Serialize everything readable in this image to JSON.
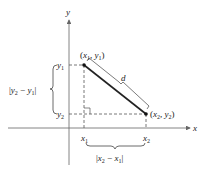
{
  "diagram": {
    "axes": {
      "x_label": "x",
      "y_label": "y"
    },
    "points": {
      "p1": {
        "label_x": "x",
        "label_y": "y",
        "sub": "1",
        "text": "(x1, y1)"
      },
      "p2": {
        "label_x": "x",
        "label_y": "y",
        "sub": "2",
        "text": "(x2, y2)"
      }
    },
    "ticks": {
      "x1": {
        "base": "x",
        "sub": "1"
      },
      "x2": {
        "base": "x",
        "sub": "2"
      },
      "y1": {
        "base": "y",
        "sub": "1"
      },
      "y2": {
        "base": "y",
        "sub": "2"
      }
    },
    "distance_label": "d",
    "vertical_diff": "|y2 − y1|",
    "horizontal_diff": "|x2 − x1|",
    "colors": {
      "line": "#222222",
      "background": "#ffffff"
    }
  }
}
